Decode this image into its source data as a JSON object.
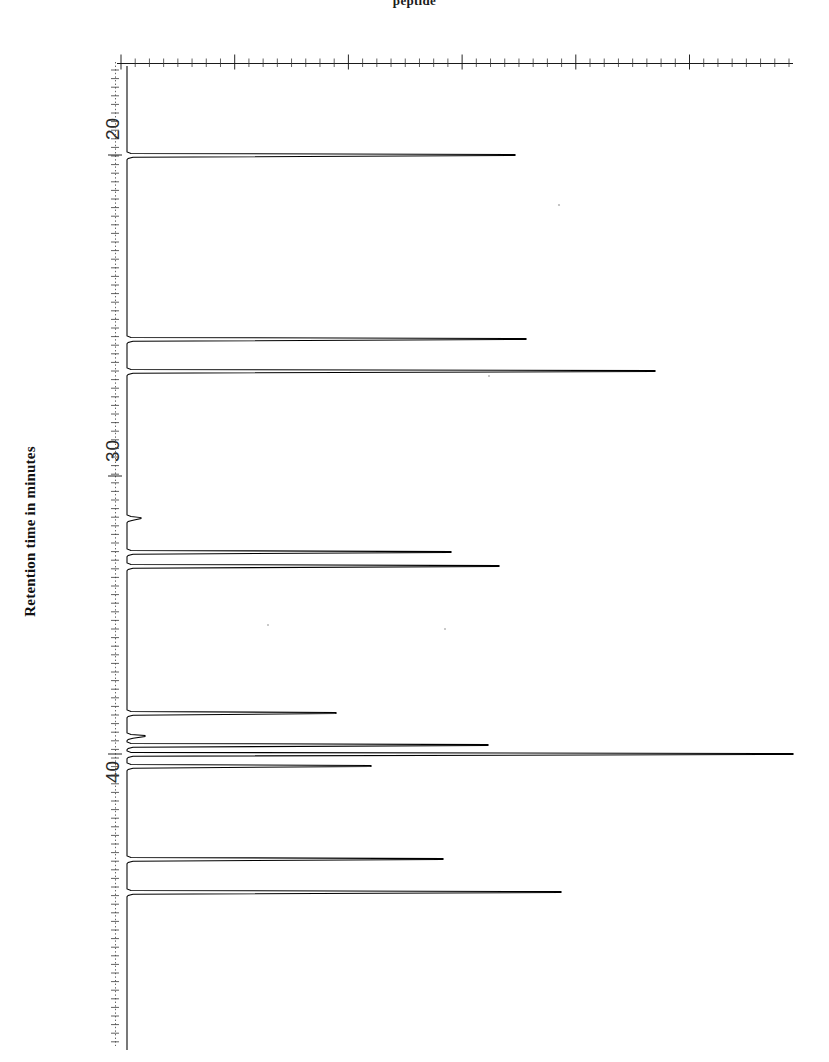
{
  "page": {
    "background_color": "#ffffff",
    "ink_color": "#000000",
    "width": 829,
    "height": 1062,
    "top_fragment_text": "peptide"
  },
  "axis": {
    "title": "Retention time in minutes",
    "title_orientation": "vertical-rotated-90",
    "tick_labels": [
      {
        "text": "20",
        "value": 20,
        "y": 122
      },
      {
        "text": "30",
        "value": 30,
        "y": 443
      },
      {
        "text": "40",
        "value": 40,
        "y": 764
      }
    ],
    "baseline_x": 127,
    "dotted_guide_x": 115,
    "top_rule_y": 63,
    "plot_top": 63,
    "plot_bottom": 1050,
    "plot_left": 115,
    "plot_right": 793
  },
  "chart_data": {
    "type": "line",
    "subtitle": "peptide",
    "xlabel": "Retention time in minutes",
    "ylabel": "Detector response (arbitrary units)",
    "orientation": "rotated",
    "axis_note": "Retention time runs top-to-bottom; signal intensity runs left-to-right",
    "xlim": [
      17.4,
      48.2
    ],
    "ylim": [
      0,
      100
    ],
    "grid": false,
    "legend": null,
    "tick_interval_minutes": 10,
    "minor_tick_count_top_rule": 47,
    "peaks": [
      {
        "id": 1,
        "retention_time": 19.0,
        "y": 155,
        "tip_x": 515,
        "intensity": 58,
        "label": ""
      },
      {
        "id": 2,
        "retention_time": 25.7,
        "y": 339,
        "tip_x": 526,
        "intensity": 59,
        "label": ""
      },
      {
        "id": 3,
        "retention_time": 26.8,
        "y": 371,
        "tip_x": 655,
        "intensity": 78,
        "label": ""
      },
      {
        "id": 4,
        "retention_time": 31.5,
        "y": 518,
        "tip_x": 141,
        "intensity": 4,
        "label": "shoulder"
      },
      {
        "id": 5,
        "retention_time": 32.2,
        "y": 552,
        "tip_x": 451,
        "intensity": 49,
        "label": ""
      },
      {
        "id": 6,
        "retention_time": 32.6,
        "y": 566,
        "tip_x": 499,
        "intensity": 55,
        "label": ""
      },
      {
        "id": 7,
        "retention_time": 37.6,
        "y": 713,
        "tip_x": 336,
        "intensity": 31,
        "label": ""
      },
      {
        "id": 8,
        "retention_time": 38.9,
        "y": 736,
        "tip_x": 145,
        "intensity": 4,
        "label": "shoulder"
      },
      {
        "id": 9,
        "retention_time": 39.3,
        "y": 745,
        "tip_x": 488,
        "intensity": 54,
        "label": ""
      },
      {
        "id": 10,
        "retention_time": 39.6,
        "y": 754,
        "tip_x": 793,
        "intensity": 97,
        "label": "tallest"
      },
      {
        "id": 11,
        "retention_time": 39.9,
        "y": 766,
        "tip_x": 371,
        "intensity": 36,
        "label": ""
      },
      {
        "id": 12,
        "retention_time": 43.2,
        "y": 859,
        "tip_x": 443,
        "intensity": 47,
        "label": ""
      },
      {
        "id": 13,
        "retention_time": 44.1,
        "y": 892,
        "tip_x": 561,
        "intensity": 65,
        "label": ""
      }
    ]
  }
}
